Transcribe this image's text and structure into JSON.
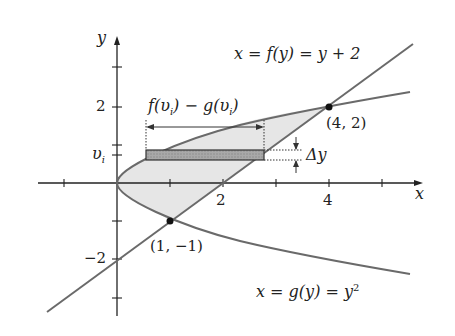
{
  "diagram": {
    "axes": {
      "x_label": "x",
      "y_label": "y",
      "x_ticks": [
        "2",
        "4"
      ],
      "y_ticks": [
        "2",
        "−2"
      ],
      "y_marker": "υ"
    },
    "y_marker_sub": "i",
    "curves": {
      "f_label": "x = f(y) = y + 2",
      "g_label": "x = g(y) = y",
      "g_label_exp": "2"
    },
    "points": [
      {
        "label": "(4, 2)",
        "x": 4,
        "y": 2
      },
      {
        "label": "(1, −1)",
        "x": 1,
        "y": -1
      }
    ],
    "width_label": "f(υ",
    "width_label_mid": ") − g(υ",
    "width_label_end": ")",
    "width_label_sub": "i",
    "delta_label": "Δy",
    "colors": {
      "region": "#e6e6e6",
      "strip": "#9e9e9e",
      "curve": "#6a6a6a",
      "axis": "#222222"
    }
  }
}
